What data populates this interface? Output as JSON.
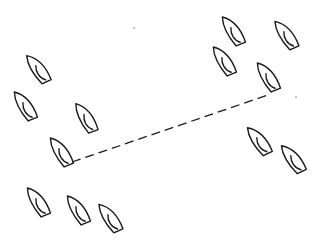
{
  "diagram": {
    "title": "",
    "background": "#ffffff",
    "stroke_color": "#1a1a1a",
    "boats": [
      {
        "id": "boat-a",
        "x": 38,
        "y": 68,
        "angle": -25
      },
      {
        "id": "boat-b",
        "x": 25,
        "y": 105,
        "angle": -22
      },
      {
        "id": "boat-c",
        "x": 86,
        "y": 117,
        "angle": -20
      },
      {
        "id": "boat-d",
        "x": 233,
        "y": 30,
        "angle": -22
      },
      {
        "id": "boat-e",
        "x": 224,
        "y": 60,
        "angle": -22
      },
      {
        "id": "boat-f",
        "x": 286,
        "y": 34,
        "angle": -24
      },
      {
        "id": "boat-g",
        "x": 268,
        "y": 76,
        "angle": -22
      },
      {
        "id": "boat-h",
        "x": 259,
        "y": 140,
        "angle": -26
      },
      {
        "id": "boat-i",
        "x": 293,
        "y": 158,
        "angle": -26
      },
      {
        "id": "boat-j",
        "x": 38,
        "y": 201,
        "angle": -22
      },
      {
        "id": "boat-k",
        "x": 78,
        "y": 209,
        "angle": -22
      },
      {
        "id": "boat-l",
        "x": 110,
        "y": 217,
        "angle": -24
      },
      {
        "id": "boat-m",
        "x": 61,
        "y": 151,
        "angle": -22
      }
    ],
    "dashed_line": {
      "x1": 72,
      "y1": 162,
      "x2": 268,
      "y2": 95
    },
    "specks": [
      {
        "x": 134,
        "y": 28
      },
      {
        "x": 296,
        "y": 97
      }
    ]
  }
}
